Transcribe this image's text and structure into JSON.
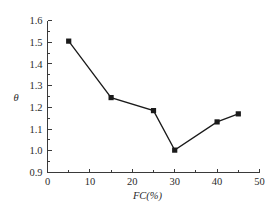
{
  "chart_data": {
    "type": "line",
    "title": "",
    "subtitle": "",
    "xlabel": "FC(%)",
    "ylabel": "θ",
    "xlim": [
      0,
      50
    ],
    "ylim": [
      0.9,
      1.6
    ],
    "xticks": [
      "0",
      "10",
      "20",
      "30",
      "40",
      "50"
    ],
    "xtick_values": [
      0,
      10,
      20,
      30,
      40,
      50
    ],
    "yticks": [
      "0.9",
      "1.0",
      "1.1",
      "1.2",
      "1.3",
      "1.4",
      "1.5",
      "1.6"
    ],
    "ytick_values": [
      0.9,
      1.0,
      1.1,
      1.2,
      1.3,
      1.4,
      1.5,
      1.6
    ],
    "grid": false,
    "legend": false,
    "legend_position": "none",
    "marker": "filled-square",
    "line_color": "#1a1a1a",
    "marker_color": "#1a1a1a",
    "axis_color": "#3a3a3a",
    "x": [
      5,
      15,
      25,
      30,
      40,
      45
    ],
    "values": [
      1.505,
      1.245,
      1.185,
      1.003,
      1.133,
      1.17
    ],
    "series": [
      {
        "name": "theta",
        "x": [
          5,
          15,
          25,
          30,
          40,
          45
        ],
        "values": [
          1.505,
          1.245,
          1.185,
          1.003,
          1.133,
          1.17
        ]
      }
    ],
    "annotations": []
  }
}
